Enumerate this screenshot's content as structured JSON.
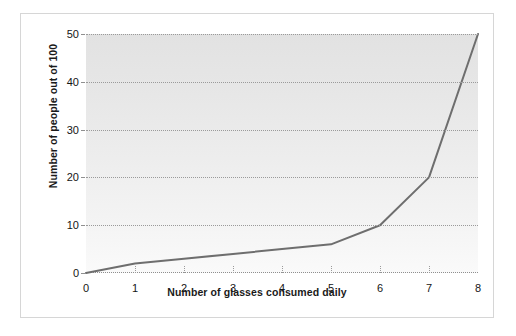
{
  "chart_data": {
    "type": "line",
    "title": "",
    "xlabel": "Number of glasses consumed daily",
    "ylabel": "Number of people out of 100",
    "x": [
      0,
      1,
      2,
      3,
      4,
      5,
      6,
      7,
      8
    ],
    "values": [
      0,
      2,
      3,
      4,
      5,
      6,
      10,
      20,
      50
    ],
    "series": [
      {
        "name": "Number of people out of 100",
        "values": [
          0,
          2,
          3,
          4,
          5,
          6,
          10,
          20,
          50
        ]
      }
    ],
    "xlim": [
      0,
      8
    ],
    "ylim": [
      0,
      50
    ],
    "xticks": [
      0,
      1,
      2,
      3,
      4,
      5,
      6,
      7,
      8
    ],
    "xtick_labels": [
      "0",
      "1",
      "2",
      "3",
      "4",
      "5",
      "6",
      "7",
      "8"
    ],
    "yticks": [
      0,
      10,
      20,
      30,
      40,
      50
    ],
    "ytick_labels": [
      "0",
      "10",
      "20",
      "30",
      "40",
      "50"
    ],
    "grid": "horizontal-dotted",
    "legend": "none",
    "line_color": "#6e6e6e",
    "line_width": 2,
    "plot_background": "#e9e9e9",
    "figure_border_color": "#d6d6d6",
    "tick_color": "#8f8f8f",
    "text_color": "#151515"
  }
}
